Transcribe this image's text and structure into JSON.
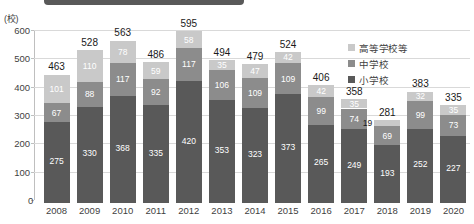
{
  "chart_data": {
    "type": "bar",
    "stacked": true,
    "title": "",
    "subtitle": "",
    "xlabel": "",
    "ylabel": "(校)",
    "ylim": [
      0,
      600
    ],
    "ytick_step": 100,
    "yticks": [
      "600",
      "500",
      "400",
      "300",
      "200",
      "100",
      "0"
    ],
    "grid": true,
    "legend_position": "right",
    "categories": [
      "2008",
      "2009",
      "2010",
      "2011",
      "2012",
      "2013",
      "2014",
      "2015",
      "2016",
      "2017",
      "2018",
      "2019",
      "2020"
    ],
    "series": [
      {
        "name": "小学校",
        "color": "#595959",
        "values": [
          275,
          330,
          368,
          335,
          420,
          353,
          323,
          373,
          265,
          249,
          193,
          252,
          227
        ]
      },
      {
        "name": "中学校",
        "color": "#8c8c8c",
        "values": [
          67,
          88,
          117,
          92,
          117,
          106,
          109,
          109,
          99,
          74,
          69,
          99,
          73
        ]
      },
      {
        "name": "高等学校等",
        "color": "#c9c9c9",
        "values": [
          101,
          110,
          78,
          59,
          58,
          35,
          47,
          42,
          42,
          35,
          19,
          32,
          35
        ]
      }
    ],
    "totals": [
      463,
      528,
      563,
      486,
      595,
      494,
      479,
      524,
      406,
      358,
      281,
      383,
      335
    ],
    "total_outside_2018": "19"
  },
  "colors": {
    "high_school": "#c9c9c9",
    "junior_high": "#8c8c8c",
    "elementary": "#595959",
    "gridline": "#d9d9d9",
    "axis": "#bfbfbf",
    "text": "#3f3f3f",
    "top_bar": "#595959"
  },
  "legend": {
    "items": [
      {
        "label": "高等学校等"
      },
      {
        "label": "中学校"
      },
      {
        "label": "小学校"
      }
    ]
  },
  "axis": {
    "unit_label": "(校)",
    "zero": "0"
  }
}
